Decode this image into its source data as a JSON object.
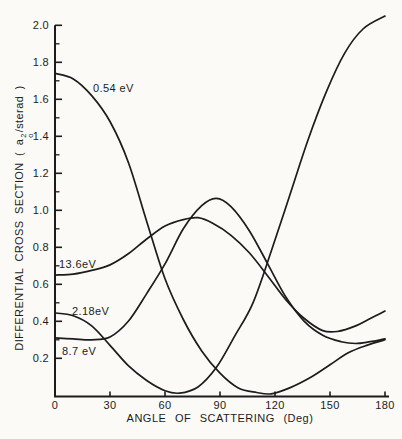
{
  "figure": {
    "bg": "#fbfaf7",
    "ink": "#1c1c1c"
  },
  "y_axis": {
    "title_prefix": "DIFFERENTIAL CROSS SECTION ( a",
    "title_sup": "2",
    "title_sub": "o",
    "title_suffix": "/sterad )",
    "tick_labels": [
      "0.2",
      "0.4",
      "0.6",
      "0.8",
      "1.0",
      "1.2",
      "1.4",
      "1.6",
      "1.8",
      "2.0"
    ]
  },
  "x_axis": {
    "title": "ANGLE OF SCATTERING (Deg)",
    "tick_labels": [
      "0",
      "30",
      "60",
      "90",
      "120",
      "150",
      "180"
    ]
  },
  "chart_data": {
    "type": "line",
    "title": "",
    "xlabel": "ANGLE OF SCATTERING (Deg)",
    "ylabel": "DIFFERENTIAL CROSS SECTION (a_o^2/sterad)",
    "xlim": [
      0,
      180
    ],
    "ylim": [
      0,
      2.0
    ],
    "grid": false,
    "legend_position": "inline-curve-labels",
    "x_ticks": [
      0,
      30,
      60,
      90,
      120,
      150,
      180
    ],
    "y_ticks": [
      0.2,
      0.4,
      0.6,
      0.8,
      1.0,
      1.2,
      1.4,
      1.6,
      1.8,
      2.0
    ],
    "series": [
      {
        "name": "0.54 eV",
        "label": "0.54 eV",
        "points": [
          [
            0,
            1.74
          ],
          [
            10,
            1.71
          ],
          [
            20,
            1.62
          ],
          [
            30,
            1.48
          ],
          [
            40,
            1.26
          ],
          [
            50,
            0.94
          ],
          [
            60,
            0.63
          ],
          [
            70,
            0.41
          ],
          [
            80,
            0.24
          ],
          [
            90,
            0.12
          ],
          [
            100,
            0.04
          ],
          [
            110,
            0.015
          ],
          [
            118,
            0.008
          ],
          [
            128,
            0.04
          ],
          [
            140,
            0.1
          ],
          [
            150,
            0.165
          ],
          [
            160,
            0.23
          ],
          [
            170,
            0.27
          ],
          [
            180,
            0.3
          ]
        ]
      },
      {
        "name": "2.18 eV",
        "label": "2.18eV",
        "points": [
          [
            0,
            0.445
          ],
          [
            10,
            0.43
          ],
          [
            20,
            0.375
          ],
          [
            30,
            0.27
          ],
          [
            40,
            0.16
          ],
          [
            50,
            0.08
          ],
          [
            60,
            0.025
          ],
          [
            68,
            0.012
          ],
          [
            78,
            0.045
          ],
          [
            88,
            0.15
          ],
          [
            98,
            0.32
          ],
          [
            108,
            0.5
          ],
          [
            118,
            0.78
          ],
          [
            128,
            1.08
          ],
          [
            138,
            1.38
          ],
          [
            148,
            1.64
          ],
          [
            158,
            1.85
          ],
          [
            168,
            1.98
          ],
          [
            180,
            2.05
          ]
        ]
      },
      {
        "name": "8.7 eV",
        "label": "8.7 eV",
        "points": [
          [
            0,
            0.31
          ],
          [
            10,
            0.305
          ],
          [
            20,
            0.3
          ],
          [
            30,
            0.315
          ],
          [
            40,
            0.4
          ],
          [
            50,
            0.55
          ],
          [
            60,
            0.71
          ],
          [
            70,
            0.9
          ],
          [
            80,
            1.025
          ],
          [
            88,
            1.065
          ],
          [
            96,
            1.02
          ],
          [
            106,
            0.89
          ],
          [
            116,
            0.71
          ],
          [
            126,
            0.53
          ],
          [
            136,
            0.4
          ],
          [
            146,
            0.325
          ],
          [
            156,
            0.29
          ],
          [
            164,
            0.28
          ],
          [
            172,
            0.29
          ],
          [
            180,
            0.305
          ]
        ]
      },
      {
        "name": "13.6 eV",
        "label": "13.6eV",
        "points": [
          [
            0,
            0.65
          ],
          [
            10,
            0.655
          ],
          [
            20,
            0.675
          ],
          [
            30,
            0.705
          ],
          [
            40,
            0.765
          ],
          [
            50,
            0.845
          ],
          [
            60,
            0.915
          ],
          [
            70,
            0.95
          ],
          [
            78,
            0.96
          ],
          [
            86,
            0.93
          ],
          [
            96,
            0.865
          ],
          [
            106,
            0.77
          ],
          [
            116,
            0.645
          ],
          [
            126,
            0.515
          ],
          [
            136,
            0.415
          ],
          [
            146,
            0.35
          ],
          [
            154,
            0.345
          ],
          [
            164,
            0.375
          ],
          [
            172,
            0.415
          ],
          [
            180,
            0.455
          ]
        ]
      }
    ]
  }
}
